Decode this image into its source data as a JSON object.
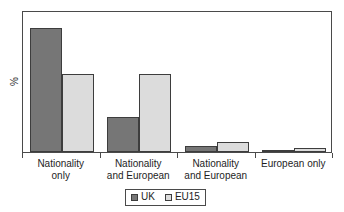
{
  "chart_data": {
    "type": "bar",
    "title": "",
    "xlabel": "",
    "ylabel": "%",
    "ylim": [
      0,
      100
    ],
    "grid": false,
    "legend_position": "bottom-center",
    "categories": [
      "Nationality only",
      "Nationality and European",
      "Nationality and European",
      "European only"
    ],
    "category_lines": [
      [
        "Nationality",
        "only"
      ],
      [
        "Nationality",
        "and European"
      ],
      [
        "Nationality",
        "and European"
      ],
      [
        "European only",
        ""
      ]
    ],
    "series": [
      {
        "name": "UK",
        "color": "#767676",
        "values": [
          87,
          25,
          4,
          1.5
        ]
      },
      {
        "name": "EU15",
        "color": "#dcdcdc",
        "values": [
          55,
          55,
          7,
          3
        ]
      }
    ]
  },
  "legend": {
    "entries": [
      {
        "label": "UK",
        "swatch": "uk-swatch-icon"
      },
      {
        "label": "EU15",
        "swatch": "eu15-swatch-icon"
      }
    ]
  },
  "axis": {
    "y_label": "%"
  },
  "colors": {
    "uk": "#767676",
    "eu15": "#dcdcdc",
    "frame": "#4a4a4a",
    "bar_outline": "#3d3d3d",
    "text": "#1e1e1e",
    "background": "#ffffff"
  }
}
